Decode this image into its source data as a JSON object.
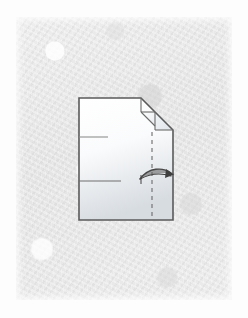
{
  "figure": {
    "title": "origami fold step diagram",
    "background": {
      "page_color": "#fdfdfd",
      "paper_panel_color": "#e8e8e8",
      "paper_texture": "mottled-handmade-paper"
    },
    "model": {
      "name": "folded-paper-model",
      "fill_top_color": "#ffffff",
      "fill_bottom_color": "#d8dde2",
      "outline_color": "#5a5a5a",
      "outline_width_px": 1.6,
      "outline_points": "79,98 141,98 173,130 173,220 79,220",
      "vertices": [
        {
          "name": "top-left",
          "x": 79,
          "y": 98
        },
        {
          "name": "top-right-of-flat-edge",
          "x": 141,
          "y": 98
        },
        {
          "name": "right-upper-corner",
          "x": 173,
          "y": 130
        },
        {
          "name": "bottom-right",
          "x": 173,
          "y": 220
        },
        {
          "name": "bottom-left",
          "x": 79,
          "y": 220
        }
      ]
    },
    "creases": [
      {
        "name": "upper-diagonal-crease",
        "kind": "solid",
        "points": "141,112 155,126",
        "color": "#6b6b6b"
      },
      {
        "name": "flap-vertical-crease",
        "kind": "solid",
        "points": "141,98 141,112",
        "color": "#6b6b6b"
      },
      {
        "name": "flap-horizontal-crease",
        "kind": "solid",
        "points": "141,112 155,112",
        "color": "#6b6b6b"
      },
      {
        "name": "lower-flap-diagonal-crease",
        "kind": "solid",
        "points": "141,112 155,126",
        "color": "#6b6b6b"
      },
      {
        "name": "right-inner-vertical-crease",
        "kind": "solid",
        "points": "155,112 155,130",
        "color": "#6b6b6b"
      },
      {
        "name": "right-horizontal-crease",
        "kind": "solid",
        "points": "155,130 173,130",
        "color": "#6b6b6b"
      },
      {
        "name": "left-upper-short-crease",
        "kind": "solid",
        "points": "79,137 108,137",
        "color": "#8a8a8a"
      },
      {
        "name": "left-lower-short-crease",
        "kind": "solid",
        "points": "79,181 121,181",
        "color": "#6e6e6e"
      },
      {
        "name": "valley-fold-line",
        "kind": "dashed",
        "points": "152,132 152,219",
        "color": "#6b6b6b",
        "dash_pattern": "4 4"
      }
    ],
    "arrow": {
      "name": "fold-direction-arrow",
      "style": "curved-blade",
      "direction": "right",
      "color": "#4a4a4a",
      "path": "M 140,179 C 150,168 164,168 172,174",
      "tail_tick": "M 140,178 L 140,181",
      "head_points": "172,170 174,175 166,177"
    },
    "labels": {
      "step_number": "",
      "caption": ""
    }
  }
}
